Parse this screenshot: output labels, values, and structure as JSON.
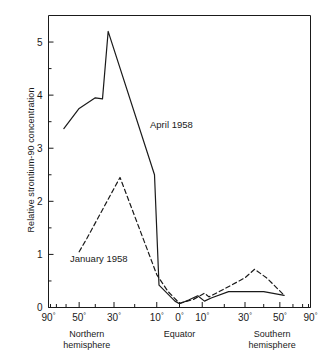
{
  "chart_data": {
    "type": "line",
    "title": "",
    "xlabel": "",
    "ylabel": "Relative strontium-90 concentration",
    "ylim": [
      0,
      5.5
    ],
    "yticks": [
      0,
      1,
      2,
      3,
      4,
      5
    ],
    "ytick_labels": [
      "0",
      "1",
      "2",
      "3",
      "4",
      "5"
    ],
    "y_minor_ticks": [
      0.5,
      1.5,
      2.5,
      3.5,
      4.5
    ],
    "grid": false,
    "legend_position": "inline-annotation",
    "x_axis_scale": "sine-latitude",
    "x_axis_note": "Latitude plotted on an equal-area (sine of latitude) scale, 90 degrees N at left to 90 degrees S at right",
    "xtick_labels": [
      "90°",
      "50°",
      "30°",
      "10°",
      "0°",
      "10°",
      "30°",
      "50°",
      "90°"
    ],
    "xtick_latitudes": [
      90,
      50,
      30,
      10,
      0,
      -10,
      -30,
      -50,
      -90
    ],
    "x_minor_tick_latitudes": [
      80,
      70,
      60,
      40,
      20,
      -20,
      -40,
      -60,
      -70,
      -80
    ],
    "x_group_labels": [
      {
        "line1": "Northern",
        "line2": "hemisphere"
      },
      {
        "line1": "Equator",
        "line2": ""
      },
      {
        "line1": "Southern",
        "line2": "hemisphere"
      }
    ],
    "series": [
      {
        "name": "April 1958",
        "style": "solid",
        "color": "#1a1a1a",
        "label_text": "April 1958",
        "points": [
          {
            "lat": 62,
            "value": 3.37
          },
          {
            "lat": 50,
            "value": 3.75
          },
          {
            "lat": 40,
            "value": 3.95
          },
          {
            "lat": 36,
            "value": 3.93
          },
          {
            "lat": 33,
            "value": 5.2
          },
          {
            "lat": 11,
            "value": 2.5
          },
          {
            "lat": 9,
            "value": 0.42
          },
          {
            "lat": 2,
            "value": 0.12
          },
          {
            "lat": 0,
            "value": 0.07
          },
          {
            "lat": -4,
            "value": 0.14
          },
          {
            "lat": -8,
            "value": 0.22
          },
          {
            "lat": -11,
            "value": 0.12
          },
          {
            "lat": -14,
            "value": 0.18
          },
          {
            "lat": -22,
            "value": 0.3
          },
          {
            "lat": -40,
            "value": 0.3
          },
          {
            "lat": -53,
            "value": 0.23
          }
        ]
      },
      {
        "name": "January 1958",
        "style": "dashed",
        "color": "#1a1a1a",
        "label_text": "January 1958",
        "points": [
          {
            "lat": 50,
            "value": 1.05
          },
          {
            "lat": 45,
            "value": 1.3
          },
          {
            "lat": 27,
            "value": 2.45
          },
          {
            "lat": 10,
            "value": 0.62
          },
          {
            "lat": 5,
            "value": 0.3
          },
          {
            "lat": 0,
            "value": 0.08
          },
          {
            "lat": -6,
            "value": 0.15
          },
          {
            "lat": -11,
            "value": 0.27
          },
          {
            "lat": -13,
            "value": 0.2
          },
          {
            "lat": -20,
            "value": 0.35
          },
          {
            "lat": -30,
            "value": 0.56
          },
          {
            "lat": -35,
            "value": 0.72
          },
          {
            "lat": -42,
            "value": 0.55
          },
          {
            "lat": -53,
            "value": 0.23
          }
        ]
      }
    ]
  }
}
